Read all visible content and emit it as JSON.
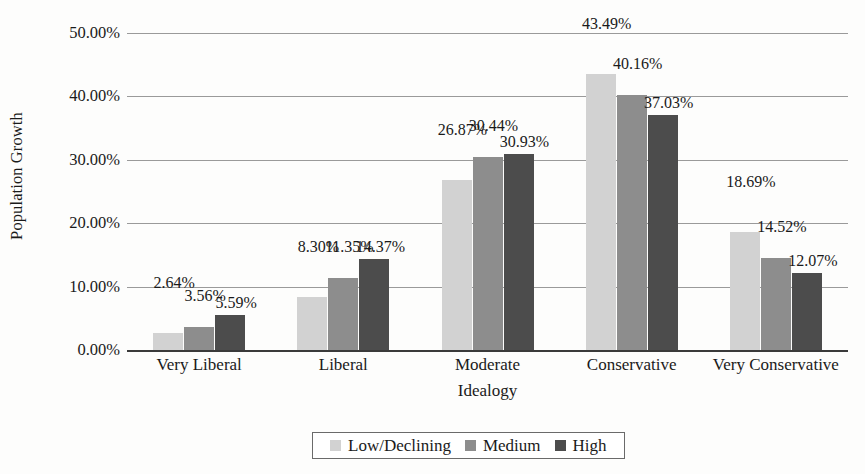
{
  "chart_data": {
    "type": "bar",
    "title": "",
    "xlabel": "Idealogy",
    "ylabel": "Population Growth",
    "categories": [
      "Very Liberal",
      "Liberal",
      "Moderate",
      "Conservative",
      "Very Conservative"
    ],
    "series": [
      {
        "name": "Low/Declining",
        "color": "#d2d2d2",
        "values": [
          2.64,
          8.3,
          26.87,
          43.49,
          18.69
        ],
        "labels": [
          "2.64%",
          "8.30%",
          "26.87%",
          "43.49%",
          "18.69%"
        ]
      },
      {
        "name": "Medium",
        "color": "#8d8d8d",
        "values": [
          3.56,
          11.35,
          30.44,
          40.16,
          14.52
        ],
        "labels": [
          "3.56%",
          "11.35%",
          "30.44%",
          "40.16%",
          "14.52%"
        ]
      },
      {
        "name": "High",
        "color": "#4c4c4c",
        "values": [
          5.59,
          14.37,
          30.93,
          37.03,
          12.07
        ],
        "labels": [
          "5.59%",
          "14.37%",
          "30.93%",
          "37.03%",
          "12.07%"
        ]
      }
    ],
    "ylim": [
      0,
      50
    ],
    "y_ticks": [
      0,
      10,
      20,
      30,
      40,
      50
    ],
    "y_tick_labels": [
      "0.00%",
      "10.00%",
      "20.00%",
      "30.00%",
      "40.00%",
      "50.00%"
    ],
    "grid": true,
    "legend_position": "bottom",
    "data_labels": true
  },
  "legend": {
    "items": [
      {
        "label": "Low/Declining"
      },
      {
        "label": "Medium"
      },
      {
        "label": "High"
      }
    ]
  }
}
